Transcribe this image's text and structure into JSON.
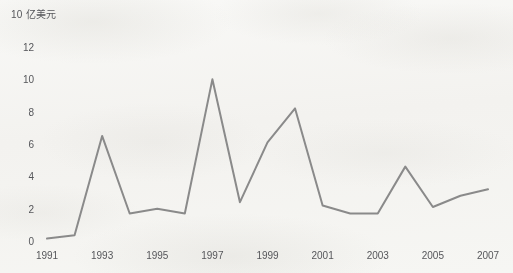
{
  "chart_data": {
    "type": "line",
    "title": "",
    "ylabel": "10 亿美元",
    "xlabel": "",
    "ylim": [
      0,
      12
    ],
    "yticks": [
      0,
      2,
      4,
      6,
      8,
      10,
      12
    ],
    "xlim": [
      1991,
      2007
    ],
    "xticks": [
      1991,
      1993,
      1995,
      1997,
      1999,
      2001,
      2003,
      2005,
      2007
    ],
    "grid": false,
    "legend": "none",
    "line_color": "#8a8a8a",
    "x": [
      1991,
      1992,
      1993,
      1994,
      1995,
      1996,
      1997,
      1998,
      1999,
      2000,
      2001,
      2002,
      2003,
      2004,
      2005,
      2006,
      2007
    ],
    "values": [
      0.15,
      0.35,
      6.5,
      1.7,
      2.0,
      1.7,
      10.0,
      2.4,
      6.1,
      8.2,
      2.2,
      1.7,
      1.7,
      4.6,
      2.1,
      2.8,
      3.2
    ],
    "series": [
      {
        "name": "",
        "values": [
          0.15,
          0.35,
          6.5,
          1.7,
          2.0,
          1.7,
          10.0,
          2.4,
          6.1,
          8.2,
          2.2,
          1.7,
          1.7,
          4.6,
          2.1,
          2.8,
          3.2
        ]
      }
    ]
  },
  "axis": {
    "y_title": "10 亿美元",
    "y_labels": [
      "12",
      "10",
      "8",
      "6",
      "4",
      "2",
      "0"
    ],
    "x_labels": [
      "1991",
      "1993",
      "1995",
      "1997",
      "1999",
      "2001",
      "2003",
      "2005",
      "2007"
    ]
  }
}
